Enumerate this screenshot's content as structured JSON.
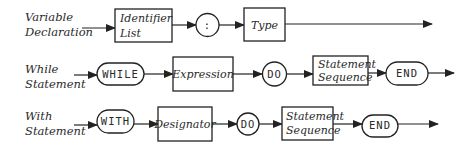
{
  "diagram": {
    "type": "syntax-diagram",
    "rows": [
      {
        "label": [
          "Variable",
          "Declaration"
        ],
        "elements": [
          {
            "kind": "nonterminal",
            "lines": [
              "Identifier",
              "List"
            ]
          },
          {
            "kind": "terminal-circle",
            "text": ":"
          },
          {
            "kind": "nonterminal",
            "lines": [
              "Type"
            ]
          }
        ]
      },
      {
        "label": [
          "While",
          "Statement"
        ],
        "elements": [
          {
            "kind": "terminal-pill",
            "text": "WHILE"
          },
          {
            "kind": "nonterminal",
            "lines": [
              "Expression"
            ]
          },
          {
            "kind": "terminal-circle",
            "text": "DO"
          },
          {
            "kind": "nonterminal",
            "lines": [
              "Statement",
              "Sequence"
            ]
          },
          {
            "kind": "terminal-pill",
            "text": "END"
          }
        ]
      },
      {
        "label": [
          "With",
          "Statement"
        ],
        "elements": [
          {
            "kind": "terminal-pill",
            "text": "WITH"
          },
          {
            "kind": "nonterminal",
            "lines": [
              "Designator"
            ]
          },
          {
            "kind": "terminal-circle",
            "text": "DO"
          },
          {
            "kind": "nonterminal",
            "lines": [
              "Statement",
              "Sequence"
            ]
          },
          {
            "kind": "terminal-pill",
            "text": "END"
          }
        ]
      }
    ]
  },
  "colors": {
    "stroke": "#222222",
    "text": "#2a2a2a",
    "background": "#ffffff"
  }
}
